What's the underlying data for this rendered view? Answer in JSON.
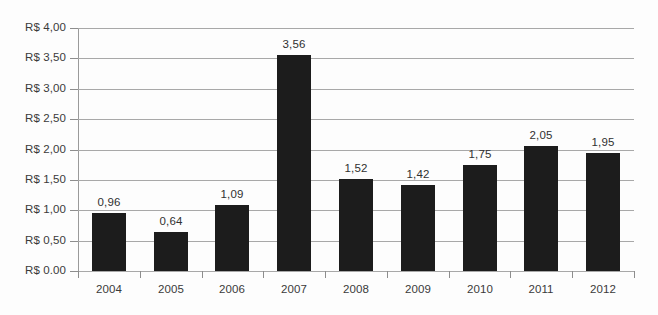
{
  "chart_data": {
    "type": "bar",
    "title": "",
    "subtitle": "",
    "xlabel": "",
    "ylabel": "",
    "categories": [
      "2004",
      "2005",
      "2006",
      "2007",
      "2008",
      "2009",
      "2010",
      "2011",
      "2012"
    ],
    "values": [
      0.96,
      0.64,
      1.09,
      3.56,
      1.52,
      1.42,
      1.75,
      2.05,
      1.95
    ],
    "value_labels": [
      "0,96",
      "0,64",
      "1,09",
      "3,56",
      "1,52",
      "1,42",
      "1,75",
      "2,05",
      "1,95"
    ],
    "ylim": [
      0,
      4.0
    ],
    "ytick_values": [
      4.0,
      3.5,
      3.0,
      2.5,
      2.0,
      1.5,
      1.0,
      0.5,
      0.0
    ],
    "ytick_labels": [
      "R$ 4,00",
      "R$ 3,50",
      "R$ 3,00",
      "R$ 2,50",
      "R$ 2,00",
      "R$ 1,50",
      "R$ 1,00",
      "R$ 0,50",
      "R$ 0.00"
    ],
    "grid": true,
    "grid_axis": "y",
    "legend": false,
    "legend_position": "none",
    "series_color": "#1c1c1c",
    "grid_color": "#a8a8a8",
    "text_color": "#3a3a3a",
    "background_color": "#fdfdfd",
    "currency_prefix": "R$",
    "decimal_separator": ","
  }
}
